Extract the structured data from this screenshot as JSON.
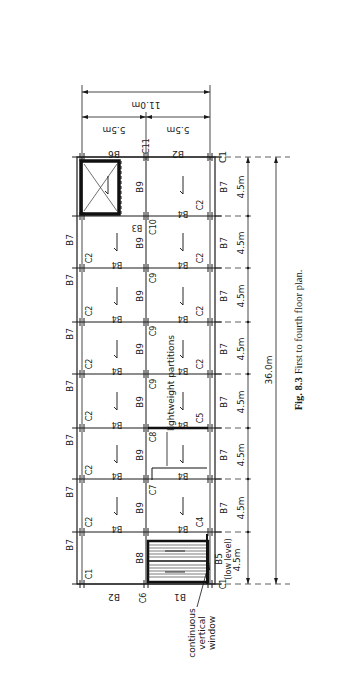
{
  "figure": {
    "caption_number": "Fig. 8.3",
    "caption_text": "First to fourth floor plan."
  },
  "dimensions": {
    "overall_width": "11.0m",
    "half_width_left": "5.5m",
    "half_width_right": "5.5m",
    "overall_length": "36.0m",
    "bay": "4.5m",
    "bays": [
      "4.5m",
      "4.5m",
      "4.5m",
      "4.5m",
      "4.5m",
      "4.5m",
      "4.5m",
      "4.5m"
    ]
  },
  "labels": {
    "top_edge": [
      "B6",
      "C11",
      "B2",
      "C1"
    ],
    "bottom_edge": [
      "B2",
      "C6",
      "B1",
      "C1"
    ],
    "outer_beams_left": [
      "B7",
      "B7",
      "B7",
      "B7",
      "B7",
      "B7",
      "B7"
    ],
    "outer_beams_right": [
      "B7",
      "B7",
      "B7",
      "B7",
      "B7",
      "B7",
      "B7"
    ],
    "spine_beams": [
      "B9",
      "B9",
      "B9",
      "B9",
      "B9",
      "B9",
      "B9",
      "B8"
    ],
    "inner_beam": "B4",
    "lift_beam": "B3",
    "stair_beam": "B5",
    "stair_beam_note": "(low level)",
    "columns_left": [
      "C2",
      "C2",
      "C2",
      "C2",
      "C2",
      "C2",
      "C1"
    ],
    "columns_mid": [
      "C10",
      "C9",
      "C9",
      "C9",
      "C8",
      "C7"
    ],
    "columns_right": [
      "C2",
      "C2",
      "C2",
      "C2",
      "C5",
      "C4",
      "C1"
    ],
    "partition_note": "lightweight partitions",
    "window_note_1": "continuous",
    "window_note_2": "vertical",
    "window_note_3": "window"
  }
}
